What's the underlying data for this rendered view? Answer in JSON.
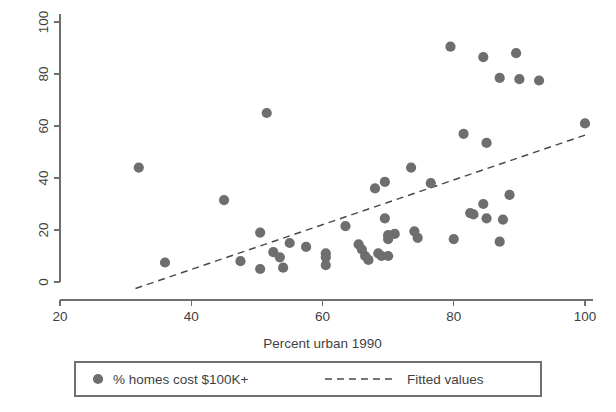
{
  "chart_data": {
    "type": "scatter",
    "title": "",
    "subtitle": "",
    "xlabel": "Percent urban 1990",
    "ylabel": "",
    "xlim": [
      20,
      100
    ],
    "ylim": [
      0,
      100
    ],
    "xticks": [
      20,
      40,
      60,
      80,
      100
    ],
    "yticks": [
      0,
      20,
      40,
      60,
      80,
      100
    ],
    "xtick_labels": [
      "20",
      "40",
      "60",
      "80",
      "100"
    ],
    "ytick_labels": [
      "0",
      "20",
      "40",
      "60",
      "80",
      "100"
    ],
    "grid": false,
    "y_tick_label_rotation": -90,
    "legend_position": "below-axis",
    "marker_color": "#6e6e6e",
    "line_color": "#4a4a4a",
    "axis_color": "#6f6f6f",
    "series": [
      {
        "name": "% homes cost $100K+",
        "type": "scatter",
        "marker": "filled-circle",
        "color": "#6e6e6e",
        "points": [
          [
            32.0,
            44.0
          ],
          [
            36.0,
            7.5
          ],
          [
            45.0,
            31.5
          ],
          [
            47.5,
            8.0
          ],
          [
            50.5,
            19.0
          ],
          [
            50.5,
            5.0
          ],
          [
            51.5,
            65.0
          ],
          [
            52.5,
            11.5
          ],
          [
            53.5,
            9.5
          ],
          [
            54.0,
            5.5
          ],
          [
            55.0,
            15.0
          ],
          [
            57.5,
            13.5
          ],
          [
            60.5,
            11.0
          ],
          [
            60.5,
            9.5
          ],
          [
            60.5,
            6.5
          ],
          [
            63.5,
            21.5
          ],
          [
            65.5,
            14.5
          ],
          [
            66.0,
            12.5
          ],
          [
            66.5,
            10.0
          ],
          [
            67.0,
            8.5
          ],
          [
            68.0,
            36.0
          ],
          [
            68.5,
            11.0
          ],
          [
            69.0,
            10.0
          ],
          [
            69.5,
            38.5
          ],
          [
            69.5,
            24.5
          ],
          [
            70.0,
            18.0
          ],
          [
            70.0,
            16.5
          ],
          [
            70.0,
            10.0
          ],
          [
            71.0,
            18.5
          ],
          [
            73.5,
            44.0
          ],
          [
            74.0,
            19.5
          ],
          [
            74.5,
            17.0
          ],
          [
            76.5,
            38.0
          ],
          [
            79.5,
            90.5
          ],
          [
            80.0,
            16.5
          ],
          [
            81.5,
            57.0
          ],
          [
            82.5,
            26.5
          ],
          [
            83.0,
            26.0
          ],
          [
            84.5,
            30.0
          ],
          [
            84.5,
            86.5
          ],
          [
            85.0,
            53.5
          ],
          [
            85.0,
            24.5
          ],
          [
            87.0,
            78.5
          ],
          [
            87.0,
            15.5
          ],
          [
            87.5,
            24.0
          ],
          [
            88.5,
            33.5
          ],
          [
            89.5,
            88.0
          ],
          [
            90.0,
            78.0
          ],
          [
            93.0,
            77.5
          ],
          [
            100.0,
            61.0
          ]
        ]
      },
      {
        "name": "Fitted values",
        "type": "line",
        "style": "dashed",
        "color": "#4a4a4a",
        "endpoints": [
          [
            31.5,
            -2.5
          ],
          [
            100.0,
            56.5
          ]
        ]
      }
    ]
  },
  "legend": {
    "items": [
      {
        "label": "% homes cost $100K+",
        "marker": "filled-circle"
      },
      {
        "label": "Fitted values",
        "marker": "dashed-line"
      }
    ]
  },
  "axes": {
    "x_title": "Percent urban 1990"
  }
}
